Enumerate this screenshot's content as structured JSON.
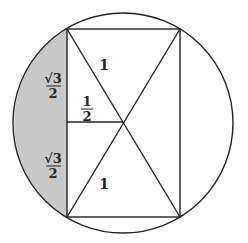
{
  "diagram": {
    "type": "geometry",
    "colors": {
      "stroke": "#222222",
      "shade": "#c9c9c9",
      "background": "#ffffff"
    },
    "circle": {
      "cx": 123,
      "cy": 123,
      "r": 110
    },
    "rectangle": {
      "x1": 67,
      "y1": 29,
      "x2": 180,
      "y2": 217
    },
    "center_point": {
      "x": 123,
      "y": 122
    },
    "labels": {
      "top_diagonal": "1",
      "bottom_diagonal": "1",
      "half": {
        "numerator": "1",
        "denominator": "2"
      },
      "upper_side": {
        "numerator": "√3",
        "denominator": "2"
      },
      "lower_side": {
        "numerator": "√3",
        "denominator": "2"
      }
    }
  }
}
